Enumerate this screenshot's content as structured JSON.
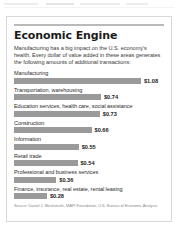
{
  "card": {
    "title": "Economic Engine",
    "intro": "Manufacturing has a big impact on the U.S. economy's health. Every dollar of value added in these areas generates the following amounts of additional transactions:",
    "source": "Source: Daniel J. Meckstroth, MAPI Foundation, U.S. Bureau of Economic Analysis",
    "bar_color": "#9a9a9a",
    "rule_color": "#b9b9b9",
    "border_color": "#d8d8d8"
  },
  "chart_data": {
    "type": "bar",
    "title": "Economic Engine",
    "orientation": "horizontal",
    "xlabel": "",
    "ylabel": "",
    "xlim": [
      0,
      1.08
    ],
    "grid": false,
    "legend": false,
    "categories": [
      "Manufacturing",
      "Transportation, warehousing",
      "Education services, health care, social assistance",
      "Construction",
      "Information",
      "Retail trade",
      "Professional and business services",
      "Finance, insurance, real estate, rental leasing"
    ],
    "values": [
      1.08,
      0.74,
      0.73,
      0.66,
      0.55,
      0.54,
      0.36,
      0.28
    ],
    "value_labels": [
      "$1.08",
      "$0.74",
      "$0.73",
      "$0.66",
      "$0.55",
      "$0.54",
      "$0.36",
      "$0.28"
    ],
    "units": "dollars of additional transactions per dollar of value added"
  }
}
